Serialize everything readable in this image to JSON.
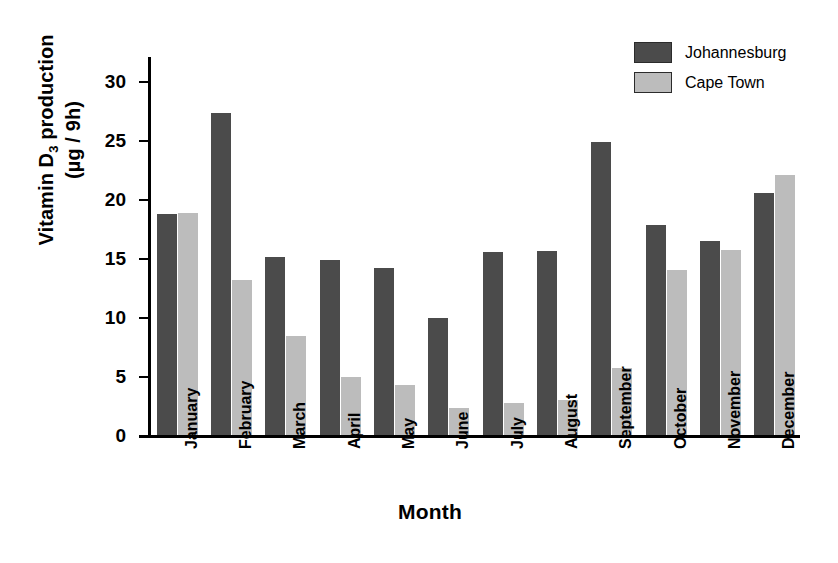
{
  "chart_data": {
    "type": "bar",
    "title": "",
    "xlabel": "Month",
    "ylabel_line1": "Vitamin D3 production",
    "ylabel_line2": "(µg / 9h)",
    "ylabel_base": "Vitamin D",
    "ylabel_subscript": "3",
    "ylabel_rest": " production",
    "ylim": [
      0,
      32
    ],
    "yticks": [
      0,
      5,
      10,
      15,
      20,
      25,
      30
    ],
    "ytick_labels": [
      "0",
      "5",
      "10",
      "15",
      "20",
      "25",
      "30"
    ],
    "grid": false,
    "legend_position": "top-right",
    "categories": [
      "January",
      "February",
      "March",
      "April",
      "May",
      "June",
      "July",
      "August",
      "September",
      "October",
      "November",
      "December"
    ],
    "series": [
      {
        "name": "Johannesburg",
        "color": "#4b4b4b",
        "values": [
          18.7,
          27.3,
          15.1,
          14.8,
          14.1,
          9.9,
          15.5,
          15.6,
          24.8,
          17.8,
          16.4,
          20.5
        ]
      },
      {
        "name": "Cape Town",
        "color": "#bcbcbc",
        "values": [
          18.8,
          13.1,
          8.4,
          4.9,
          4.2,
          2.3,
          2.7,
          3.0,
          5.7,
          14.0,
          15.7,
          22.0
        ]
      }
    ]
  },
  "legend": {
    "items": [
      {
        "label": "Johannesburg",
        "color": "#4b4b4b"
      },
      {
        "label": "Cape Town",
        "color": "#bcbcbc"
      }
    ]
  }
}
